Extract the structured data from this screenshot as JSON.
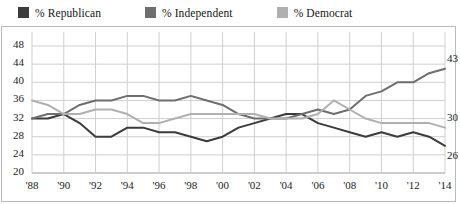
{
  "legend": {
    "items": [
      {
        "label": "% Republican",
        "color": "#3b3b3b",
        "key": "republican"
      },
      {
        "label": "% Independent",
        "color": "#6e6e6e",
        "key": "independent"
      },
      {
        "label": "% Democrat",
        "color": "#b0b0b0",
        "key": "democrat"
      }
    ]
  },
  "chart_data": {
    "type": "line",
    "title": "",
    "subtitle": "",
    "xlabel": "",
    "ylabel": "",
    "grid": true,
    "legend_position": "top",
    "xlim": [
      1988,
      2014
    ],
    "ylim": [
      20,
      48
    ],
    "ytick_step": 4,
    "yticks": [
      20,
      24,
      28,
      32,
      36,
      40,
      44,
      48
    ],
    "ytick_labels": [
      "20",
      "24",
      "28",
      "32",
      "36",
      "40",
      "44",
      "48"
    ],
    "xticks": [
      1988,
      1990,
      1992,
      1994,
      1996,
      1998,
      2000,
      2002,
      2004,
      2006,
      2008,
      2010,
      2012,
      2014
    ],
    "xtick_labels": [
      "'88",
      "'90",
      "'92",
      "'94",
      "'96",
      "'98",
      "'00",
      "'02",
      "'04",
      "'06",
      "'08",
      "'10",
      "'12",
      "'14"
    ],
    "x": [
      1988,
      1989,
      1990,
      1991,
      1992,
      1993,
      1994,
      1995,
      1996,
      1997,
      1998,
      1999,
      2000,
      2001,
      2002,
      2003,
      2004,
      2005,
      2006,
      2007,
      2008,
      2009,
      2010,
      2011,
      2012,
      2013,
      2014
    ],
    "series": [
      {
        "name": "% Republican",
        "color": "#3b3b3b",
        "end_label": "26",
        "end_value": 26,
        "values": [
          32,
          32,
          33,
          31,
          28,
          28,
          30,
          30,
          29,
          29,
          28,
          27,
          28,
          30,
          31,
          32,
          33,
          33,
          31,
          30,
          29,
          28,
          29,
          28,
          29,
          28,
          26
        ]
      },
      {
        "name": "% Independent",
        "color": "#6e6e6e",
        "end_label": "43",
        "end_value": 43,
        "values": [
          32,
          33,
          33,
          35,
          36,
          36,
          37,
          37,
          36,
          36,
          37,
          36,
          35,
          33,
          32,
          32,
          32,
          33,
          34,
          33,
          34,
          37,
          38,
          40,
          40,
          42,
          43
        ]
      },
      {
        "name": "% Democrat",
        "color": "#b0b0b0",
        "end_label": "30",
        "end_value": 30,
        "values": [
          36,
          35,
          33,
          33,
          34,
          34,
          33,
          31,
          31,
          32,
          33,
          33,
          33,
          33,
          33,
          32,
          32,
          32,
          33,
          36,
          34,
          32,
          31,
          31,
          31,
          31,
          30
        ]
      }
    ]
  }
}
